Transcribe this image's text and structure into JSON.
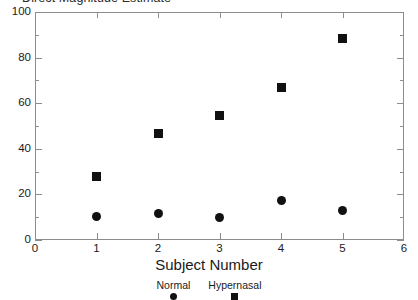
{
  "chart_data": {
    "type": "scatter",
    "title": "Direct Magnitude Estimate",
    "xlabel": "Subject Number",
    "ylabel": "",
    "xlim": [
      0,
      6
    ],
    "ylim": [
      0,
      100
    ],
    "grid": false,
    "legend_position": "bottom",
    "x": [
      1,
      2,
      3,
      4,
      5
    ],
    "xticks": [
      "0",
      "1",
      "2",
      "3",
      "4",
      "5",
      "6"
    ],
    "yticks": [
      "0",
      "20",
      "40",
      "60",
      "80",
      "100"
    ],
    "yticks_minor": [
      10,
      30,
      50,
      70,
      90
    ],
    "series": [
      {
        "name": "Normal",
        "marker": "circle",
        "color": "#111111",
        "values": [
          10.5,
          11.5,
          10,
          17.5,
          13
        ]
      },
      {
        "name": "Hypernasal",
        "marker": "square",
        "color": "#111111",
        "values": [
          28,
          46.5,
          54.5,
          67,
          88.5
        ]
      }
    ]
  },
  "legend": {
    "normal_label": "Normal",
    "hypernasal_label": "Hypernasal"
  }
}
